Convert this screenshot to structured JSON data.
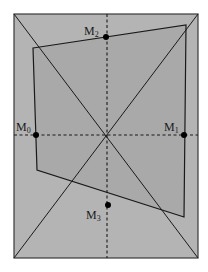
{
  "figure": {
    "width": 208,
    "height": 272,
    "colors": {
      "background": "#ffffff",
      "photo_fill": "#b4b4b4",
      "inner_region_fill": "#a9a9a9",
      "line": "#1a1a1a",
      "point": "#000000"
    },
    "outer_rect": {
      "x1": 14,
      "y1": 14,
      "x2": 198,
      "y2": 258
    },
    "center": {
      "x": 107,
      "y": 135
    },
    "inner_quad": [
      {
        "x": 33,
        "y": 48
      },
      {
        "x": 186,
        "y": 25
      },
      {
        "x": 184,
        "y": 217
      },
      {
        "x": 37,
        "y": 170
      }
    ],
    "points": [
      {
        "id": "M0",
        "base": "M",
        "sub": "0",
        "x": 36,
        "y": 135,
        "label_x": 16,
        "label_y": 130
      },
      {
        "id": "M1",
        "base": "M",
        "sub": "1",
        "x": 184,
        "y": 135,
        "label_x": 164,
        "label_y": 130
      },
      {
        "id": "M2",
        "base": "M",
        "sub": "2",
        "x": 106,
        "y": 37,
        "label_x": 84,
        "label_y": 34
      },
      {
        "id": "M3",
        "base": "M",
        "sub": "3",
        "x": 108,
        "y": 205,
        "label_x": 86,
        "label_y": 218
      }
    ],
    "labels": {
      "m0": "M",
      "m0_sub": "0",
      "m1": "M",
      "m1_sub": "1",
      "m2": "M",
      "m2_sub": "2",
      "m3": "M",
      "m3_sub": "3"
    }
  }
}
